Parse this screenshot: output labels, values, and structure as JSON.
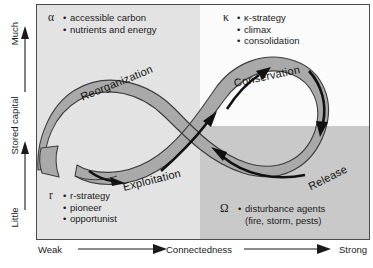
{
  "figure": {
    "type": "adaptive-cycle-diagram"
  },
  "axes": {
    "y": {
      "title": "Stored capital",
      "low_label": "Little",
      "high_label": "Much",
      "direction": "upward"
    },
    "x": {
      "title": "Connectedness",
      "low_label": "Weak",
      "high_label": "Strong",
      "direction": "rightward"
    }
  },
  "quadrants": {
    "top_left": "#e3e3e3",
    "top_right": "#fbfbfb",
    "bottom_left": "#e3e3e3",
    "bottom_right": "#c9c9c9"
  },
  "phases": [
    {
      "key": "reorganization",
      "label": "Reorganization"
    },
    {
      "key": "exploitation",
      "label": "Exploitation"
    },
    {
      "key": "conservation",
      "label": "Conservation"
    },
    {
      "key": "release",
      "label": "Release"
    }
  ],
  "annotations": [
    {
      "key": "alpha",
      "symbol": "α",
      "position": "top-left",
      "items": [
        "accessible carbon",
        "nutrients and energy"
      ]
    },
    {
      "key": "kappa",
      "symbol": "κ",
      "position": "top-right",
      "items": [
        "κ-strategy",
        "climax",
        "consolidation"
      ]
    },
    {
      "key": "r",
      "symbol": "r",
      "position": "bottom-left",
      "items": [
        "r-strategy",
        "pioneer",
        "opportunist"
      ]
    },
    {
      "key": "omega",
      "symbol": "Ω",
      "position": "bottom-right",
      "items": [
        "disturbance agents"
      ],
      "continuation": "(fire, storm, pests)"
    }
  ],
  "ribbon": {
    "fill": "#a8a8a8",
    "stroke": "#3a3a3a",
    "arrow_color": "#111111"
  }
}
